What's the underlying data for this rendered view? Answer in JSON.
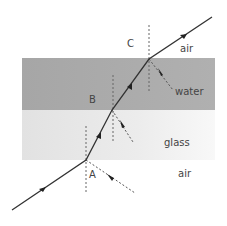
{
  "diagram": {
    "media": [
      {
        "name": "air",
        "label": "air",
        "position": "top"
      },
      {
        "name": "water",
        "label": "water",
        "color": "#a9a9a9"
      },
      {
        "name": "glass",
        "label": "glass",
        "color": "#e6e6e6"
      },
      {
        "name": "air",
        "label": "air",
        "position": "bottom"
      }
    ],
    "points": [
      {
        "id": "A",
        "label": "A",
        "boundary": "air-glass"
      },
      {
        "id": "B",
        "label": "B",
        "boundary": "glass-water"
      },
      {
        "id": "C",
        "label": "C",
        "boundary": "water-air"
      }
    ],
    "labels": {
      "air_top": "air",
      "water": "water",
      "glass": "glass",
      "air_bottom": "air",
      "point_a": "A",
      "point_b": "B",
      "point_c": "C"
    },
    "colors": {
      "ray": "#333333",
      "normal": "#666666",
      "water_band": "#a9a9a9",
      "glass_band": "#e6e6e6"
    }
  }
}
